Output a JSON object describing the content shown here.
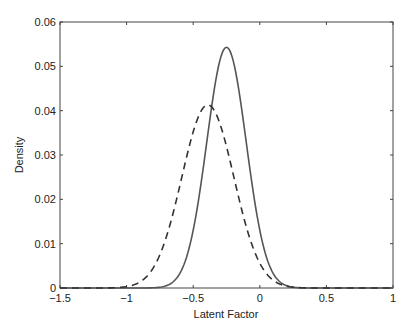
{
  "chart_data": {
    "type": "line",
    "title": "",
    "xlabel": "Latent Factor",
    "ylabel": "Density",
    "xlim": [
      -1.5,
      1
    ],
    "ylim": [
      0,
      0.06
    ],
    "x_ticks": [
      "-1.5",
      "-1",
      "-0.5",
      "0",
      "0.5",
      "1"
    ],
    "y_ticks": [
      "0",
      "0.01",
      "0.02",
      "0.03",
      "0.04",
      "0.05",
      "0.06"
    ],
    "grid": false,
    "legend": null,
    "series": [
      {
        "name": "solid",
        "style": "solid",
        "color": "#555555",
        "distribution": "normal",
        "mean": -0.25,
        "peak": 0.0543,
        "x": [
          -1.5,
          -1.0,
          -0.8,
          -0.7,
          -0.6,
          -0.5,
          -0.4,
          -0.3,
          -0.25,
          -0.2,
          -0.1,
          0.0,
          0.1,
          0.2,
          0.3,
          0.5,
          1.0
        ],
        "y": [
          0.0,
          0.0,
          0.0012,
          0.0035,
          0.0085,
          0.0195,
          0.035,
          0.0515,
          0.0543,
          0.0515,
          0.035,
          0.0195,
          0.0085,
          0.0029,
          0.0007,
          0.0,
          0.0
        ]
      },
      {
        "name": "dashed",
        "style": "dashed",
        "color": "#333333",
        "distribution": "normal",
        "mean": -0.39,
        "peak": 0.0413,
        "x": [
          -1.5,
          -1.2,
          -1.0,
          -0.9,
          -0.8,
          -0.7,
          -0.6,
          -0.5,
          -0.39,
          -0.3,
          -0.2,
          -0.1,
          0.0,
          0.1,
          0.2,
          0.3,
          0.5,
          1.0
        ],
        "y": [
          0.0002,
          0.0015,
          0.0048,
          0.0085,
          0.0135,
          0.0205,
          0.0285,
          0.0365,
          0.0413,
          0.0385,
          0.031,
          0.022,
          0.0135,
          0.007,
          0.003,
          0.0011,
          0.0001,
          0.0
        ]
      }
    ]
  }
}
